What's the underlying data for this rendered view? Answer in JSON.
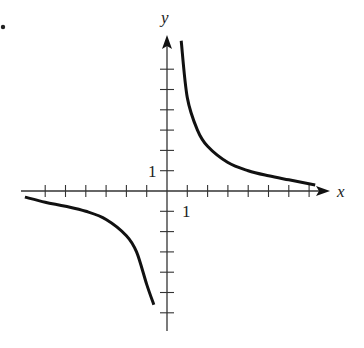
{
  "bullet": "•",
  "chart_data": {
    "type": "line",
    "title": "",
    "xlabel": "x",
    "ylabel": "y",
    "tick_labels": {
      "x": "1",
      "y": "1"
    },
    "xlim": [
      -7,
      8
    ],
    "ylim": [
      -7,
      8
    ],
    "grid": false,
    "series": [
      {
        "name": "right branch",
        "x": [
          0.7,
          1,
          1.5,
          2,
          3,
          4,
          5,
          6,
          7.3
        ],
        "y": [
          7.4,
          4.6,
          3.0,
          2.2,
          1.4,
          1.0,
          0.75,
          0.55,
          0.3
        ]
      },
      {
        "name": "left branch",
        "x": [
          -7,
          -6,
          -5,
          -4,
          -3,
          -2,
          -1.5,
          -1,
          -0.65
        ],
        "y": [
          -0.3,
          -0.55,
          -0.75,
          -1.0,
          -1.4,
          -2.2,
          -3.0,
          -4.6,
          -5.6
        ]
      }
    ]
  }
}
